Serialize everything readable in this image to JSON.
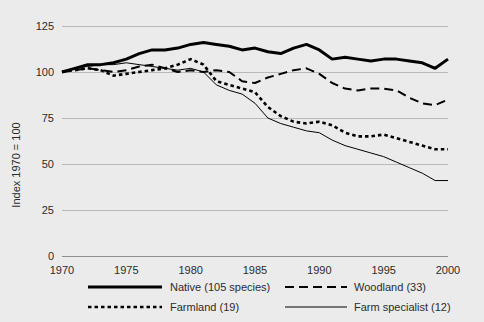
{
  "chart_data": {
    "type": "line",
    "title": "",
    "subtitle": "",
    "xlabel": "",
    "ylabel": "Index 1970 = 100",
    "xlim": [
      1970,
      2000
    ],
    "ylim": [
      0,
      125
    ],
    "yticks": [
      0,
      25,
      50,
      75,
      100,
      125
    ],
    "xticks": [
      1970,
      1975,
      1980,
      1985,
      1990,
      1995,
      2000
    ],
    "grid": true,
    "legend_position": "bottom",
    "x": [
      1970,
      1971,
      1972,
      1973,
      1974,
      1975,
      1976,
      1977,
      1978,
      1979,
      1980,
      1981,
      1982,
      1983,
      1984,
      1985,
      1986,
      1987,
      1988,
      1989,
      1990,
      1991,
      1992,
      1993,
      1994,
      1995,
      1996,
      1997,
      1998,
      1999,
      2000
    ],
    "series": [
      {
        "name": "Native (105 species)",
        "style": "solid-thick",
        "values": [
          100,
          102,
          104,
          104,
          105,
          107,
          110,
          112,
          112,
          113,
          115,
          116,
          115,
          114,
          112,
          113,
          111,
          110,
          113,
          115,
          112,
          107,
          108,
          107,
          106,
          107,
          107,
          106,
          105,
          102,
          107
        ]
      },
      {
        "name": "Woodland (33)",
        "style": "dashed",
        "values": [
          100,
          101,
          102,
          101,
          100,
          101,
          103,
          104,
          102,
          100,
          101,
          100,
          101,
          100,
          95,
          94,
          97,
          99,
          101,
          102,
          99,
          94,
          91,
          90,
          91,
          91,
          90,
          86,
          83,
          82,
          85
        ]
      },
      {
        "name": "Farmland (19)",
        "style": "dotted",
        "values": [
          100,
          101,
          102,
          101,
          98,
          99,
          100,
          101,
          102,
          104,
          107,
          104,
          95,
          93,
          91,
          89,
          81,
          76,
          73,
          72,
          73,
          71,
          67,
          65,
          65,
          66,
          64,
          62,
          60,
          58,
          58
        ]
      },
      {
        "name": "Farm specialist (12)",
        "style": "solid-thin",
        "values": [
          100,
          102,
          103,
          104,
          104,
          105,
          104,
          103,
          102,
          101,
          102,
          100,
          93,
          90,
          88,
          83,
          75,
          72,
          70,
          68,
          67,
          63,
          60,
          58,
          56,
          54,
          51,
          48,
          45,
          41,
          41
        ]
      }
    ]
  },
  "axis": {
    "y_title": "Index 1970 = 100",
    "y_ticks": [
      "125",
      "100",
      "75",
      "50",
      "25",
      "0"
    ],
    "x_ticks": [
      "1970",
      "1975",
      "1980",
      "1985",
      "1990",
      "1995",
      "2000"
    ]
  },
  "legend": {
    "entries": [
      {
        "label": "Native (105 species)",
        "style": "solid-thick"
      },
      {
        "label": "Woodland (33)",
        "style": "dashed"
      },
      {
        "label": "Farmland (19)",
        "style": "dotted"
      },
      {
        "label": "Farm specialist (12)",
        "style": "solid-thin"
      }
    ]
  },
  "colors": {
    "background": "#ebebeb",
    "line": "#000000",
    "grid": "#b9b9b9",
    "text": "#2b2b2b"
  }
}
